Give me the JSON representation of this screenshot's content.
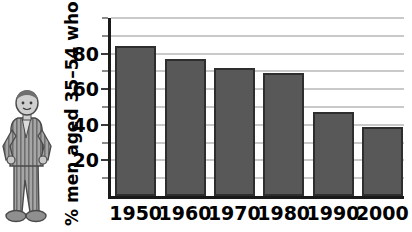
{
  "chart_data": {
    "type": "bar",
    "title": "",
    "xlabel": "",
    "ylabel": "% men aged 35–54 who smoke",
    "categories": [
      "1950",
      "1960",
      "1970",
      "1980",
      "1990",
      "2000"
    ],
    "values": [
      84,
      77,
      72,
      69,
      47,
      39
    ],
    "ylim": [
      0,
      100
    ],
    "yticks": [
      20,
      40,
      60,
      80
    ],
    "ytick_labels": [
      "20",
      "40",
      "60",
      "80"
    ],
    "minor_gridlines": [
      10,
      30,
      50,
      70,
      90,
      100
    ],
    "grid": true,
    "legend": null,
    "bar_color": "#585858",
    "bar_edge_color": "#2e2e2e",
    "axis_color": "#1a1a1a",
    "grid_color": "#c9c9c9"
  },
  "decoration": {
    "mascot_name": "cartoon-man-striped-suit",
    "mascot_description": "grey cartoon man in striped suit standing with hands on hips"
  }
}
